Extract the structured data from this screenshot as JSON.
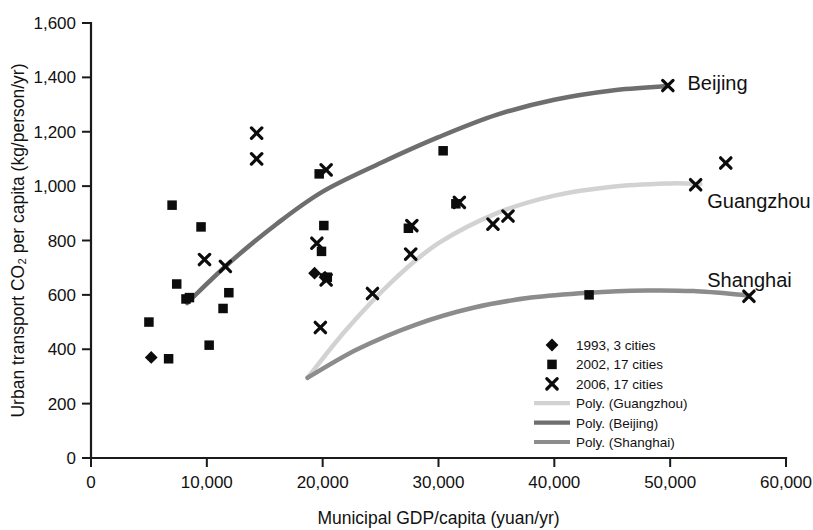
{
  "chart_data": {
    "type": "scatter",
    "title": "",
    "xlabel": "Municipal GDP/capita (yuan/yr)",
    "ylabel": "Urban transport CO₂ per capita (kg/person/yr)",
    "xlim": [
      0,
      60000
    ],
    "ylim": [
      0,
      1600
    ],
    "xticks": [
      0,
      10000,
      20000,
      30000,
      40000,
      50000,
      60000
    ],
    "xticklabels": [
      "0",
      "10,000",
      "20,000",
      "30,000",
      "40,000",
      "50,000",
      "60,000"
    ],
    "yticks": [
      0,
      200,
      400,
      600,
      800,
      1000,
      1200,
      1400,
      1600
    ],
    "yticklabels": [
      "0",
      "200",
      "400",
      "600",
      "800",
      "1,000",
      "1,200",
      "1,400",
      "1,600"
    ],
    "grid": false,
    "legend_position": "inside-lower-right",
    "series": [
      {
        "name": "1993, 3 cities",
        "marker": "diamond",
        "color": "#0c0c0c",
        "points": [
          {
            "x": 5200,
            "y": 370
          },
          {
            "x": 19300,
            "y": 680
          },
          {
            "x": 20200,
            "y": 665
          }
        ]
      },
      {
        "name": "2002, 17 cities",
        "marker": "square",
        "color": "#0c0c0c",
        "points": [
          {
            "x": 5000,
            "y": 500
          },
          {
            "x": 6700,
            "y": 365
          },
          {
            "x": 7000,
            "y": 930
          },
          {
            "x": 7400,
            "y": 640
          },
          {
            "x": 8200,
            "y": 585
          },
          {
            "x": 8500,
            "y": 590
          },
          {
            "x": 9500,
            "y": 850
          },
          {
            "x": 10200,
            "y": 415
          },
          {
            "x": 11400,
            "y": 550
          },
          {
            "x": 11900,
            "y": 608
          },
          {
            "x": 19700,
            "y": 1045
          },
          {
            "x": 20100,
            "y": 855
          },
          {
            "x": 19900,
            "y": 760
          },
          {
            "x": 20400,
            "y": 665
          },
          {
            "x": 27400,
            "y": 845
          },
          {
            "x": 31500,
            "y": 935
          },
          {
            "x": 30400,
            "y": 1130
          },
          {
            "x": 43000,
            "y": 600
          }
        ]
      },
      {
        "name": "2006, 17 cities",
        "marker": "x",
        "color": "#0c0c0c",
        "points": [
          {
            "x": 9800,
            "y": 730
          },
          {
            "x": 14300,
            "y": 1195
          },
          {
            "x": 14300,
            "y": 1100
          },
          {
            "x": 11600,
            "y": 705
          },
          {
            "x": 19500,
            "y": 790
          },
          {
            "x": 20300,
            "y": 1060
          },
          {
            "x": 20300,
            "y": 655
          },
          {
            "x": 19800,
            "y": 480
          },
          {
            "x": 24300,
            "y": 605
          },
          {
            "x": 27600,
            "y": 750
          },
          {
            "x": 27700,
            "y": 855
          },
          {
            "x": 31800,
            "y": 940
          },
          {
            "x": 34700,
            "y": 860
          },
          {
            "x": 36000,
            "y": 890
          },
          {
            "x": 49800,
            "y": 1370
          },
          {
            "x": 52200,
            "y": 1005
          },
          {
            "x": 54800,
            "y": 1085
          },
          {
            "x": 56800,
            "y": 595
          }
        ]
      }
    ],
    "trendlines": [
      {
        "name": "Poly. (Guangzhou)",
        "color": "#d2d2d2",
        "width": 4.5,
        "points": [
          {
            "x": 18700,
            "y": 295
          },
          {
            "x": 22000,
            "y": 470
          },
          {
            "x": 26000,
            "y": 650
          },
          {
            "x": 30000,
            "y": 790
          },
          {
            "x": 35000,
            "y": 900
          },
          {
            "x": 40000,
            "y": 965
          },
          {
            "x": 45000,
            "y": 998
          },
          {
            "x": 50000,
            "y": 1010
          },
          {
            "x": 52600,
            "y": 1008
          }
        ]
      },
      {
        "name": "Poly. (Beijing)",
        "color": "#6e6e6e",
        "width": 4.5,
        "points": [
          {
            "x": 8300,
            "y": 570
          },
          {
            "x": 12000,
            "y": 720
          },
          {
            "x": 16000,
            "y": 860
          },
          {
            "x": 20000,
            "y": 980
          },
          {
            "x": 25000,
            "y": 1085
          },
          {
            "x": 30000,
            "y": 1180
          },
          {
            "x": 35000,
            "y": 1262
          },
          {
            "x": 40000,
            "y": 1318
          },
          {
            "x": 45000,
            "y": 1352
          },
          {
            "x": 49800,
            "y": 1368
          }
        ]
      },
      {
        "name": "Poly. (Shanghai)",
        "color": "#8c8c8c",
        "width": 4.5,
        "points": [
          {
            "x": 18700,
            "y": 295
          },
          {
            "x": 23000,
            "y": 400
          },
          {
            "x": 28000,
            "y": 490
          },
          {
            "x": 33000,
            "y": 553
          },
          {
            "x": 38000,
            "y": 590
          },
          {
            "x": 43000,
            "y": 608
          },
          {
            "x": 48000,
            "y": 616
          },
          {
            "x": 52000,
            "y": 614
          },
          {
            "x": 56800,
            "y": 598
          }
        ]
      }
    ],
    "annotations": [
      {
        "label": "Beijing",
        "x": 51500,
        "y": 1378,
        "anchor": "start"
      },
      {
        "label": "Guangzhou",
        "x": 53200,
        "y": 945,
        "anchor": "start"
      },
      {
        "label": "Shanghai",
        "x": 53200,
        "y": 655,
        "anchor": "start"
      }
    ]
  },
  "legend": {
    "items": [
      {
        "label": "1993, 3 cities",
        "kind": "diamond",
        "color": "#0c0c0c"
      },
      {
        "label": "2002, 17 cities",
        "kind": "square",
        "color": "#0c0c0c"
      },
      {
        "label": "2006, 17 cities",
        "kind": "x",
        "color": "#0c0c0c"
      },
      {
        "label": "Poly. (Guangzhou)",
        "kind": "line",
        "color": "#d2d2d2"
      },
      {
        "label": "Poly. (Beijing)",
        "kind": "line",
        "color": "#6e6e6e"
      },
      {
        "label": "Poly. (Shanghai)",
        "kind": "line",
        "color": "#8c8c8c"
      }
    ]
  }
}
